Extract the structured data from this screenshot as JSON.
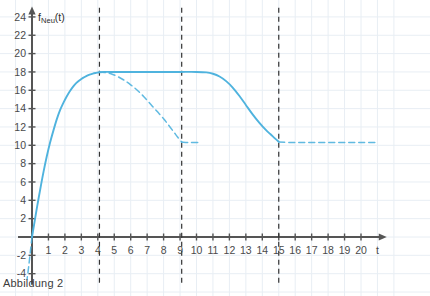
{
  "figure": {
    "caption": "Abbildung 2"
  },
  "chart_data": {
    "type": "line",
    "title": "",
    "xlabel": "t",
    "ylabel": "f_Neu(t)",
    "ylabel_base": "f",
    "ylabel_sub": "Neu",
    "ylabel_arg": "(t)",
    "xlim": [
      -0.9,
      21.5
    ],
    "ylim": [
      -5,
      25
    ],
    "xticks": [
      1,
      2,
      3,
      4,
      5,
      6,
      7,
      8,
      9,
      10,
      11,
      12,
      13,
      14,
      15,
      16,
      17,
      18,
      19,
      20
    ],
    "xtick_labels": [
      "1",
      "2",
      "3",
      "4",
      "5",
      "6",
      "7",
      "8",
      "9",
      "10",
      "11",
      "12",
      "13",
      "14",
      "15",
      "16",
      "17",
      "18",
      "19",
      "20"
    ],
    "yticks": [
      -4,
      -2,
      2,
      4,
      6,
      8,
      10,
      12,
      14,
      16,
      18,
      20,
      22,
      24
    ],
    "ytick_labels": [
      "-4",
      "-2",
      "2",
      "4",
      "6",
      "8",
      "10",
      "12",
      "14",
      "16",
      "18",
      "20",
      "22",
      "24"
    ],
    "grid": true,
    "grid_color": "#e8eef4",
    "curve_color": "#4FB3DE",
    "axis_color": "#555555",
    "marker_color": "#333333",
    "legend": [],
    "vertical_markers": [
      {
        "name": "marker-t4",
        "x": 4.1,
        "style": "dashed",
        "label": ""
      },
      {
        "name": "marker-t9",
        "x": 9.1,
        "style": "dashed",
        "label": ""
      },
      {
        "name": "marker-t15",
        "x": 15.0,
        "style": "dashed",
        "label": ""
      }
    ],
    "series": [
      {
        "name": "f-neu-solid",
        "style": "solid",
        "points": [
          [
            0.0,
            0.0
          ],
          [
            0.15,
            1.6
          ],
          [
            0.3,
            3.2
          ],
          [
            0.5,
            5.2
          ],
          [
            0.7,
            7.1
          ],
          [
            0.9,
            8.8
          ],
          [
            1.1,
            10.3
          ],
          [
            1.3,
            11.6
          ],
          [
            1.5,
            12.8
          ],
          [
            1.7,
            13.8
          ],
          [
            1.9,
            14.6
          ],
          [
            2.1,
            15.3
          ],
          [
            2.3,
            15.9
          ],
          [
            2.5,
            16.4
          ],
          [
            2.7,
            16.8
          ],
          [
            2.9,
            17.1
          ],
          [
            3.1,
            17.35
          ],
          [
            3.3,
            17.55
          ],
          [
            3.5,
            17.7
          ],
          [
            3.7,
            17.82
          ],
          [
            3.9,
            17.9
          ],
          [
            4.1,
            17.97
          ],
          [
            4.4,
            18.0
          ],
          [
            5.0,
            18.0
          ],
          [
            6.0,
            18.0
          ],
          [
            7.0,
            18.0
          ],
          [
            8.0,
            18.0
          ],
          [
            9.0,
            18.0
          ],
          [
            10.0,
            18.0
          ],
          [
            10.6,
            17.95
          ],
          [
            11.0,
            17.8
          ],
          [
            11.4,
            17.5
          ],
          [
            11.8,
            17.0
          ],
          [
            12.2,
            16.3
          ],
          [
            12.6,
            15.4
          ],
          [
            13.0,
            14.4
          ],
          [
            13.4,
            13.4
          ],
          [
            13.8,
            12.5
          ],
          [
            14.2,
            11.7
          ],
          [
            14.5,
            11.2
          ],
          [
            14.8,
            10.7
          ],
          [
            15.0,
            10.4
          ]
        ]
      },
      {
        "name": "f-neu-branch-dashed",
        "style": "dashed",
        "points": [
          [
            4.1,
            18.0
          ],
          [
            4.4,
            17.95
          ],
          [
            4.8,
            17.8
          ],
          [
            5.2,
            17.5
          ],
          [
            5.6,
            17.1
          ],
          [
            6.0,
            16.6
          ],
          [
            6.4,
            16.0
          ],
          [
            6.8,
            15.3
          ],
          [
            7.2,
            14.5
          ],
          [
            7.6,
            13.7
          ],
          [
            8.0,
            12.9
          ],
          [
            8.3,
            12.2
          ],
          [
            8.6,
            11.5
          ],
          [
            8.85,
            10.9
          ],
          [
            9.1,
            10.35
          ]
        ]
      },
      {
        "name": "f-neu-branch-tail-dashed",
        "style": "dashed",
        "points": [
          [
            9.1,
            10.35
          ],
          [
            9.6,
            10.3
          ],
          [
            10.2,
            10.3
          ]
        ]
      },
      {
        "name": "f-neu-tail-dashed",
        "style": "dashed",
        "points": [
          [
            15.0,
            10.35
          ],
          [
            16.0,
            10.3
          ],
          [
            17.0,
            10.3
          ],
          [
            18.0,
            10.3
          ],
          [
            19.0,
            10.3
          ],
          [
            20.0,
            10.3
          ],
          [
            21.0,
            10.3
          ]
        ]
      },
      {
        "name": "f-neu-below-axis-dashed",
        "style": "dashed",
        "points": [
          [
            0.0,
            0.0
          ],
          [
            -0.1,
            -1.6
          ],
          [
            -0.2,
            -3.2
          ],
          [
            -0.3,
            -4.6
          ]
        ]
      }
    ]
  }
}
